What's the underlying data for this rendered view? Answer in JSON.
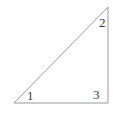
{
  "figure": {
    "background_color": "#ffffff",
    "stroke_color": "#9a9a9a",
    "label_color": "#3a3a3a",
    "stroke_width": 1
  },
  "chart_data": {
    "type": "diagram",
    "title": "",
    "subtitle": "",
    "shape": "right-triangle",
    "vertices": [
      {
        "label": "1",
        "x": 14,
        "y": 103,
        "position": "bottom-left",
        "angle_type": "acute"
      },
      {
        "label": "2",
        "x": 108,
        "y": 7,
        "position": "top-right",
        "angle_type": "acute"
      },
      {
        "label": "3",
        "x": 108,
        "y": 103,
        "position": "bottom-right",
        "angle_type": "right"
      }
    ],
    "edges": [
      {
        "from": "1",
        "to": "2",
        "name": "hypotenuse"
      },
      {
        "from": "2",
        "to": "3",
        "name": "vertical-leg"
      },
      {
        "from": "3",
        "to": "1",
        "name": "horizontal-leg"
      }
    ],
    "labels": [
      {
        "text": "1",
        "x": 30,
        "y": 98
      },
      {
        "text": "2",
        "x": 102,
        "y": 25
      },
      {
        "text": "3",
        "x": 96,
        "y": 97
      }
    ],
    "grid": false,
    "legend": null,
    "xlabel": "",
    "ylabel": ""
  },
  "polygon_points": "14,103 108,7 108,103"
}
